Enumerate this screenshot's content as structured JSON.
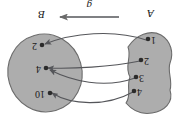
{
  "figure": {
    "kind": "function-mapping-diagram",
    "orientation_note": "rendered upside-down (180 degrees)",
    "function_label": "g",
    "arrow_direction": "right-to-left",
    "colors": {
      "blob_fill": "#adadad",
      "blob_stroke": "#6b6b6b",
      "line": "#55565a",
      "text": "#1a1a1a",
      "background": "#ffffff"
    },
    "domain_set": {
      "name": "A",
      "elements": [
        {
          "label": "1"
        },
        {
          "label": "2"
        },
        {
          "label": "3"
        },
        {
          "label": "4"
        }
      ]
    },
    "codomain_set": {
      "name": "B",
      "elements": [
        {
          "label": "2"
        },
        {
          "label": "4"
        },
        {
          "label": "10"
        }
      ]
    },
    "mappings": [
      {
        "from": "1",
        "to": "2"
      },
      {
        "from": "2",
        "to": "4"
      },
      {
        "from": "3",
        "to": "4"
      },
      {
        "from": "4",
        "to": "10"
      }
    ]
  }
}
